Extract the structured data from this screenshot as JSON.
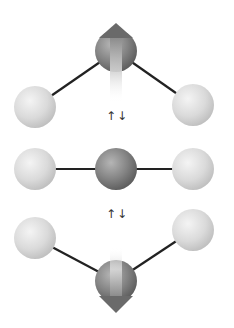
{
  "diagram": {
    "title": "",
    "colors": {
      "central_atom": "#7d7d7d",
      "outer_atom": "#d6d6d6",
      "bond": "#222222",
      "arrow": "#707070",
      "label": "#333333"
    },
    "states": [
      {
        "name": "central-up",
        "central_arrow": "up"
      },
      {
        "name": "linear",
        "central_arrow": "none"
      },
      {
        "name": "central-down",
        "central_arrow": "down"
      }
    ],
    "transition_labels": [
      "↑↓",
      "↑↓"
    ]
  }
}
